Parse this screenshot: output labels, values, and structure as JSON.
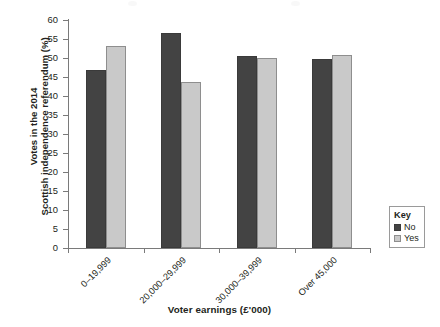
{
  "chart_data": {
    "type": "bar",
    "title": "",
    "xlabel": "Voter earnings (£'000)",
    "ylabel_lines": [
      "Votes in the 2014",
      "Scottish independence referendum (%)"
    ],
    "ylabel": "Votes in the 2014 Scottish independence referendum (%)",
    "categories": [
      "0–19,999",
      "20,000–29,999",
      "30,000–39,999",
      "Over 45,000"
    ],
    "series": [
      {
        "name": "No",
        "color": "#434343",
        "values": [
          46.8,
          56.5,
          50.4,
          49.7
        ]
      },
      {
        "name": "Yes",
        "color": "#c9c9c9",
        "values": [
          53.2,
          43.6,
          50.0,
          50.7
        ]
      }
    ],
    "ylim": [
      0,
      60
    ],
    "ytick_step": 5,
    "yticks": [
      60,
      55,
      50,
      45,
      40,
      35,
      30,
      25,
      20,
      15,
      10,
      5,
      0
    ],
    "ytick_labels": [
      "60",
      "55",
      "50",
      "45",
      "40",
      "35",
      "30",
      "25",
      "20",
      "15",
      "10",
      "5",
      "0"
    ],
    "grid": false,
    "legend_position": "right-bottom-outside",
    "legend_title": "Key",
    "xtick_label_rotation": 45
  },
  "legend": {
    "title": "Key",
    "entries": [
      {
        "label": "No",
        "color": "#434343"
      },
      {
        "label": "Yes",
        "color": "#c9c9c9"
      }
    ]
  },
  "axes": {
    "x_title": "Voter earnings (£'000)",
    "y_title_line1": "Votes in the 2014",
    "y_title_line2": "Scottish independence referendum (%)"
  },
  "colors": {
    "no_bar": "#434343",
    "yes_bar": "#c9c9c9",
    "axis": "#7a7a7a",
    "text": "#231f20",
    "background": "#ffffff"
  }
}
